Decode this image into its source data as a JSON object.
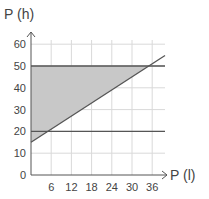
{
  "chart_data": {
    "type": "area",
    "title": "",
    "xlabel": "P(l)",
    "ylabel": "P(h)",
    "x_ticks": [
      6,
      12,
      18,
      24,
      30,
      36
    ],
    "y_ticks": [
      0,
      10,
      20,
      30,
      40,
      50,
      60
    ],
    "xlim": [
      0,
      40
    ],
    "ylim": [
      0,
      62
    ],
    "grid": true,
    "series": [
      {
        "name": "upper bound",
        "type": "line",
        "x": [
          0,
          40
        ],
        "y": [
          50,
          50
        ]
      },
      {
        "name": "lower bound",
        "type": "line",
        "x": [
          0,
          40
        ],
        "y": [
          20,
          20
        ]
      },
      {
        "name": "diagonal",
        "type": "line",
        "x": [
          0,
          40
        ],
        "y": [
          15,
          55
        ]
      }
    ],
    "shaded_region": {
      "description": "Region bounded by y=50 (top), the y-axis (left), and the diagonal line y=x+15 (bottom-right)",
      "vertices": [
        [
          0,
          15
        ],
        [
          0,
          50
        ],
        [
          35,
          50
        ]
      ],
      "color": "#c8c8c8"
    }
  },
  "labels": {
    "y_axis": "P (h)",
    "x_axis": "P (l)",
    "origin": "0"
  },
  "colors": {
    "line": "#555555",
    "grid": "#d9d9d9",
    "shade": "#c8c8c8"
  }
}
